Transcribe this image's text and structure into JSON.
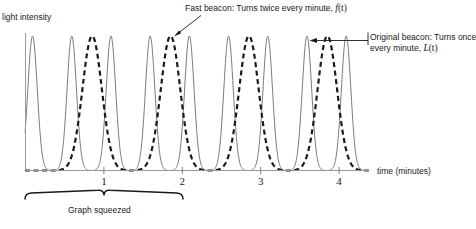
{
  "figure": {
    "y_axis_label": "light intensity",
    "x_axis_label": "time (minutes)",
    "bracket_label": "Graph squeezed",
    "annotations": {
      "fast_beacon": {
        "text": "Fast beacon: Turns twice every minute,",
        "symbol": "f",
        "symbol_arg": "(t)"
      },
      "original_beacon": {
        "line1": "Original beacon: Turns once",
        "line2": "every minute,",
        "symbol": "L",
        "symbol_arg": "(t)"
      }
    },
    "x_ticks": [
      "1",
      "2",
      "3",
      "4"
    ],
    "colors": {
      "axis": "#8c8c8c",
      "fast_curve": "#7a7a7a",
      "original_curve": "#1a1a1a",
      "text": "#1a1a1a",
      "background": "#ffffff"
    }
  },
  "chart_data": {
    "type": "line",
    "title": "",
    "xlabel": "time (minutes)",
    "ylabel": "light intensity",
    "xlim": [
      -0.09,
      4.35
    ],
    "ylim": [
      0,
      1.08
    ],
    "grid": false,
    "legend": "annotations",
    "x_ticks": [
      1,
      2,
      3,
      4
    ],
    "y_ticks": [],
    "series": [
      {
        "name": "Fast beacon: Turns twice every minute, f(t)",
        "style": "solid-thin",
        "color": "#7a7a7a",
        "description": "Narrow spikes of light intensity peaking twice every minute",
        "period_minutes": 0.5,
        "peak_times": [
          0.09,
          0.59,
          1.09,
          1.59,
          2.09,
          2.59,
          3.09,
          3.59,
          4.09
        ],
        "peak_value": 1.0,
        "baseline_value": 0.0
      },
      {
        "name": "Original beacon: Turns once every minute, L(t)",
        "style": "dashed-bold",
        "color": "#1a1a1a",
        "description": "Wider spikes of light intensity peaking once every minute",
        "period_minutes": 1.0,
        "peak_times": [
          0.85,
          1.85,
          2.85,
          3.85
        ],
        "peak_value": 1.0,
        "baseline_value": 0.0
      }
    ],
    "annotations": [
      {
        "text": "Fast beacon: Turns twice every minute, f(t)",
        "points_to_series": "fast",
        "arrow": true
      },
      {
        "text": "Original beacon: Turns once every minute, L(t)",
        "points_to_series": "original",
        "arrow": true
      },
      {
        "text": "Graph squeezed",
        "bracket_range": [
          0,
          2
        ]
      }
    ]
  }
}
